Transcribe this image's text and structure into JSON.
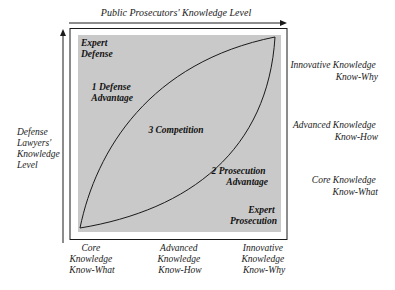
{
  "diagram": {
    "title": "Public Prosecutors' Knowledge Level",
    "y_axis_label": [
      "Defense",
      "Lawyers'",
      "Knowledge",
      "Level"
    ],
    "colors": {
      "region_fill": "#c9c9c9",
      "line": "#1a1a1a",
      "background": "#ffffff"
    },
    "regions": {
      "top_left": [
        "Expert",
        "Defense"
      ],
      "defense_advantage": [
        "1 Defense",
        "Advantage"
      ],
      "competition": "3 Competition",
      "prosecution_advantage": [
        "2 Prosecution",
        "Advantage"
      ],
      "bottom_right": [
        "Expert",
        "Prosecution"
      ]
    },
    "right_levels": [
      {
        "line1": "Innovative Knowledge",
        "line2": "Know-Why"
      },
      {
        "line1": "Advanced Knowledge",
        "line2": "Know-How"
      },
      {
        "line1": "Core Knowledge",
        "line2": "Know-What"
      }
    ],
    "bottom_levels": [
      {
        "line1": "Core",
        "line2": "Knowledge",
        "line3": "Know-What"
      },
      {
        "line1": "Advanced",
        "line2": "Knowledge",
        "line3": "Know-How"
      },
      {
        "line1": "Innovative",
        "line2": "Knowledge",
        "line3": "Know-Why"
      }
    ]
  }
}
